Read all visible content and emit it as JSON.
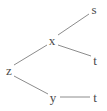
{
  "figure": {
    "kind": "node-link-graph",
    "background_color": "#ffffff",
    "edge_color": "#8c8c8c",
    "label_color": "#4a4a4a",
    "edge_width": 1,
    "width": 107,
    "height": 111
  },
  "nodes": [
    {
      "id": "s",
      "label": "s",
      "x": 94,
      "y": 9
    },
    {
      "id": "x",
      "label": "x",
      "x": 52,
      "y": 40
    },
    {
      "id": "t1",
      "label": "t",
      "x": 95,
      "y": 60
    },
    {
      "id": "z",
      "label": "z",
      "x": 9,
      "y": 70
    },
    {
      "id": "y",
      "label": "y",
      "x": 53,
      "y": 97
    },
    {
      "id": "t2",
      "label": "t",
      "x": 95,
      "y": 97
    }
  ],
  "edges": [
    {
      "from": "x",
      "to": "s",
      "x1": 58,
      "y1": 35,
      "x2": 89,
      "y2": 14
    },
    {
      "from": "x",
      "to": "t1",
      "x1": 58,
      "y1": 45,
      "x2": 91,
      "y2": 56
    },
    {
      "from": "z",
      "to": "x",
      "x1": 14,
      "y1": 65,
      "x2": 47,
      "y2": 45
    },
    {
      "from": "z",
      "to": "y",
      "x1": 14,
      "y1": 76,
      "x2": 48,
      "y2": 94
    },
    {
      "from": "y",
      "to": "t2",
      "x1": 60,
      "y1": 97,
      "x2": 90,
      "y2": 97
    }
  ]
}
